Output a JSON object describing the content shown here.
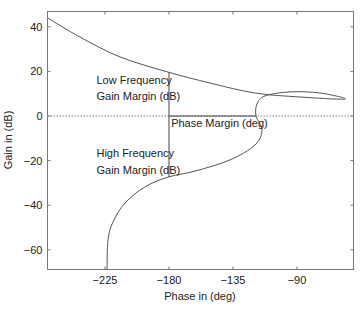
{
  "chart_data": {
    "type": "line",
    "title": "",
    "xlabel": "Phase in (deg)",
    "ylabel": "Gain in (dB)",
    "xlim": [
      -266,
      -49
    ],
    "ylim": [
      -69,
      47
    ],
    "grid": false,
    "legend": null,
    "x_ticks": [
      -225,
      -180,
      -135,
      -90
    ],
    "x_tick_labels": [
      "−225",
      "−180",
      "−135",
      "−90"
    ],
    "y_ticks": [
      40,
      20,
      0,
      -20,
      -40,
      -60
    ],
    "y_tick_labels": [
      "40",
      "20",
      "0",
      "−20",
      "−40",
      "−60"
    ],
    "series": [
      {
        "name": "Nichols curve",
        "x": [
          -265.1,
          -242.6,
          -214.5,
          -180.7,
          -151.2,
          -119.5,
          -87.9,
          -56.2,
          -73.8,
          -94.9,
          -112.5,
          -118.1,
          -118.8,
          -114.6,
          -119.5,
          -137.1,
          -161.7,
          -180.7,
          -196.9,
          -210.9,
          -219.4,
          -222.9,
          -223.6
        ],
        "y": [
          43.9,
          35.4,
          26.5,
          19.7,
          14.8,
          10.3,
          8.5,
          7.6,
          10.3,
          10.8,
          9.0,
          5.4,
          0.0,
          -6.3,
          -13.0,
          -19.7,
          -24.7,
          -27.4,
          -31.8,
          -39.0,
          -47.5,
          -55.6,
          -69.0
        ]
      }
    ],
    "reference_lines": [
      {
        "name": "zero-dB-line",
        "type": "horizontal",
        "y": 0,
        "style": "dotted"
      }
    ],
    "margin_lines": [
      {
        "name": "low-frequency-gain-margin",
        "x": [
          -180,
          -180
        ],
        "y": [
          19.7,
          0
        ]
      },
      {
        "name": "high-frequency-gain-margin",
        "x": [
          -180,
          -180
        ],
        "y": [
          0,
          -27.4
        ]
      },
      {
        "name": "phase-margin",
        "x": [
          -180,
          -118.8
        ],
        "y": [
          0,
          0
        ]
      }
    ],
    "annotations": [
      {
        "text": "Low Frequency",
        "x": -231,
        "y": 14.5
      },
      {
        "text": "Gain Margin (dB)",
        "x": -231,
        "y": 7
      },
      {
        "text": "Phase Margin (deg)",
        "x": -178.5,
        "y": -4.8
      },
      {
        "text": "High Frequency",
        "x": -231,
        "y": -18.5
      },
      {
        "text": "Gain Margin (dB)",
        "x": -231,
        "y": -26
      }
    ]
  },
  "labels": {
    "xlabel": "Phase in (deg)",
    "ylabel": "Gain in (dB)",
    "annot_low_1": "Low Frequency",
    "annot_low_2": "Gain Margin (dB)",
    "annot_phase": "Phase Margin (deg)",
    "annot_high_1": "High Frequency",
    "annot_high_2": "Gain Margin (dB)"
  },
  "colors": {
    "curve": "#555555",
    "frame": "#777777",
    "text": "#222222"
  }
}
